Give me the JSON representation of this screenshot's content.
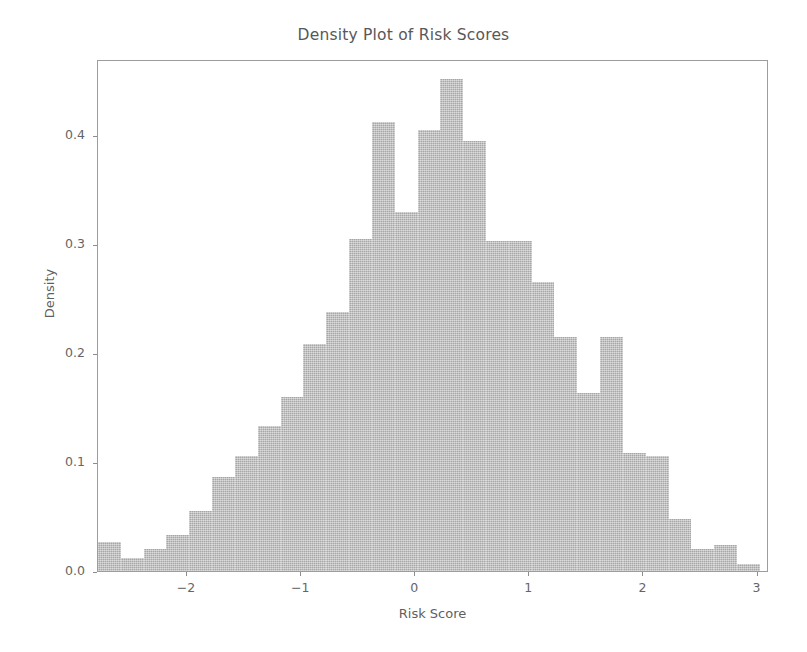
{
  "chart_data": {
    "type": "bar",
    "subtype": "histogram",
    "title": "Density Plot of Risk Scores",
    "xlabel": "Risk Score",
    "ylabel": "Density",
    "xlim": [
      -2.78,
      3.1
    ],
    "ylim": [
      0.0,
      0.47
    ],
    "xticks": [
      -2,
      -1,
      0,
      1,
      2,
      3
    ],
    "xticklabels": [
      "−2",
      "−1",
      "0",
      "1",
      "2",
      "3"
    ],
    "yticks": [
      0.0,
      0.1,
      0.2,
      0.3,
      0.4
    ],
    "yticklabels": [
      "0.0",
      "0.1",
      "0.2",
      "0.3",
      "0.4"
    ],
    "grid": true,
    "grid_color": "#ffffff",
    "bar_color": "#b9b9b9",
    "legend": null,
    "bin_width": 0.2,
    "bin_edges": [
      -2.78,
      -2.58,
      -2.38,
      -2.18,
      -1.98,
      -1.78,
      -1.58,
      -1.38,
      -1.18,
      -0.98,
      -0.78,
      -0.58,
      -0.38,
      -0.18,
      0.02,
      0.22,
      0.42,
      0.62,
      0.82,
      1.02,
      1.22,
      1.42,
      1.62,
      1.82,
      2.02,
      2.22,
      2.42,
      2.62,
      2.82,
      3.02
    ],
    "categories": [
      "-2.68",
      "-2.48",
      "-2.28",
      "-2.08",
      "-1.88",
      "-1.68",
      "-1.48",
      "-1.28",
      "-1.08",
      "-0.88",
      "-0.68",
      "-0.48",
      "-0.28",
      "-0.08",
      "0.12",
      "0.32",
      "0.52",
      "0.72",
      "0.92",
      "1.12",
      "1.32",
      "1.52",
      "1.72",
      "1.92",
      "2.12",
      "2.32",
      "2.52",
      "2.72",
      "2.92"
    ],
    "values": [
      0.027,
      0.012,
      0.02,
      0.033,
      0.055,
      0.086,
      0.106,
      0.133,
      0.16,
      0.208,
      0.238,
      0.305,
      0.412,
      0.33,
      0.405,
      0.452,
      0.395,
      0.303,
      0.303,
      0.265,
      0.215,
      0.163,
      0.215,
      0.108,
      0.106,
      0.048,
      0.02,
      0.024,
      0.006
    ]
  }
}
